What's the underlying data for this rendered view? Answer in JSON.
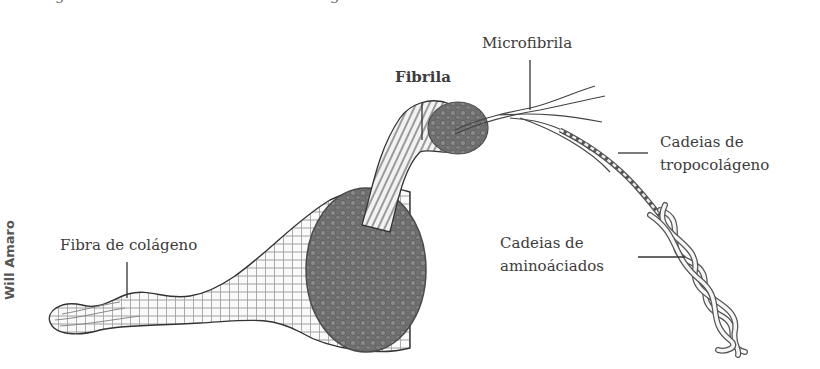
{
  "figure": {
    "credit": "Will Amaro",
    "labels": {
      "fibra": "Fibra de colágeno",
      "fibrila": "Fibrila",
      "microfibrila": "Microfibrila",
      "tropocolageno_line1": "Cadeias de",
      "tropocolageno_line2": "tropocolágeno",
      "aminoacidos_line1": "Cadeias de",
      "aminoacidos_line2": "aminoáciados"
    },
    "colors": {
      "ink": "#3c3c3c",
      "fiber_fill": "#f4f4f4",
      "bundle_fill": "#6e6e6e",
      "leader_line": "#333333"
    }
  }
}
